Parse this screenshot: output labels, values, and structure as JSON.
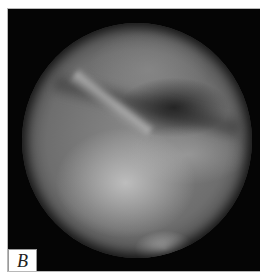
{
  "figure": {
    "panel_label": "B"
  },
  "colors": {
    "background": "#050505",
    "border": "#b8b8b8",
    "label_bg": "#ffffff"
  }
}
